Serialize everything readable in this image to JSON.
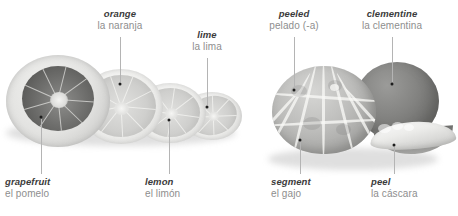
{
  "figure": {
    "style": "grayscale photographic vocabulary plate",
    "background_color": "#ffffff",
    "text_color_english": "#3b3b3b",
    "text_color_spanish": "#8e8e8e",
    "leader_line_color": "#b4b4b4",
    "marker_color": "#1d1d1d"
  },
  "labels": [
    {
      "id": "orange",
      "en": "orange",
      "es": "la naranja",
      "position": "top"
    },
    {
      "id": "lime",
      "en": "lime",
      "es": "la lima",
      "position": "top"
    },
    {
      "id": "peeled",
      "en": "peeled",
      "es": "pelado (-a)",
      "position": "top"
    },
    {
      "id": "clementine",
      "en": "clementine",
      "es": "la clementina",
      "position": "top"
    },
    {
      "id": "grapefruit",
      "en": "grapefruit",
      "es": "el pomelo",
      "position": "bottom"
    },
    {
      "id": "lemon",
      "en": "lemon",
      "es": "el limón",
      "position": "bottom"
    },
    {
      "id": "segment",
      "en": "segment",
      "es": "el gajo",
      "position": "bottom"
    },
    {
      "id": "peel",
      "en": "peel",
      "es": "la cáscara",
      "position": "bottom"
    }
  ],
  "objects": [
    {
      "id": "grapefruit-half",
      "name": "grapefruit half"
    },
    {
      "id": "orange-half",
      "name": "orange half"
    },
    {
      "id": "lemon-half",
      "name": "lemon half"
    },
    {
      "id": "lime-half",
      "name": "lime half"
    },
    {
      "id": "peeled-fruit",
      "name": "peeled clementine"
    },
    {
      "id": "whole-fruit",
      "name": "whole clementine"
    },
    {
      "id": "peel-piece",
      "name": "detached peel"
    }
  ]
}
